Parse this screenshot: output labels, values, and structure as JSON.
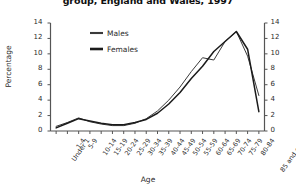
{
  "chart_data": {
    "type": "line",
    "title": "group, England and Wales, 1997",
    "xlabel": "Age",
    "ylabel": "Percentage",
    "ylim": [
      0,
      14
    ],
    "yticks": [
      0,
      2,
      4,
      6,
      8,
      10,
      12,
      14
    ],
    "right_axis": true,
    "right_yticks": [
      0,
      2,
      4,
      6,
      8,
      10,
      12,
      14
    ],
    "grid": false,
    "legend_position": "upper-left-inside",
    "categories": [
      "Under 1",
      "1-4",
      "5-9",
      "10-14",
      "15-19",
      "20-24",
      "25-29",
      "30-34",
      "35-39",
      "40-44",
      "45-49",
      "50-54",
      "55-59",
      "60-64",
      "65-69",
      "70-74",
      "75-79",
      "80-84",
      "85 and over"
    ],
    "series": [
      {
        "name": "Males",
        "values": [
          0.6,
          1.1,
          1.7,
          1.2,
          0.9,
          0.7,
          0.7,
          1.0,
          1.6,
          2.6,
          4.0,
          5.7,
          7.7,
          9.5,
          9.2,
          11.6,
          12.9,
          9.7,
          4.6
        ]
      },
      {
        "name": "Females",
        "values": [
          0.4,
          1.0,
          1.6,
          1.3,
          1.0,
          0.8,
          0.8,
          1.1,
          1.5,
          2.3,
          3.5,
          5.0,
          6.8,
          8.4,
          10.3,
          11.6,
          12.9,
          10.6,
          2.5
        ]
      }
    ]
  },
  "legend": {
    "items": [
      {
        "label": "Males",
        "style": "thin"
      },
      {
        "label": "Females",
        "style": "thick"
      }
    ]
  },
  "colors": {
    "series_males": "#3a3a3a",
    "series_females": "#1b1b1b",
    "axis": "#555555",
    "text": "#2a2a2a"
  }
}
